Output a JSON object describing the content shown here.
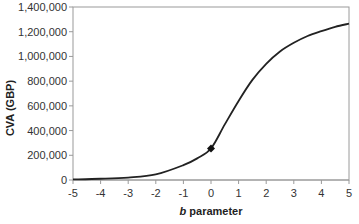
{
  "chart_data": {
    "type": "line",
    "title": "",
    "xlabel_var": "b",
    "xlabel_rest": " parameter",
    "xlabel": "b parameter",
    "ylabel": "CVA (GBP)",
    "xlim": [
      -5,
      5
    ],
    "ylim": [
      0,
      1400000
    ],
    "x_ticks": [
      "-5",
      "-4",
      "-3",
      "-2",
      "-1",
      "0",
      "1",
      "2",
      "3",
      "4",
      "5"
    ],
    "y_ticks": [
      "0",
      "200,000",
      "400,000",
      "600,000",
      "800,000",
      "1,000,000",
      "1,200,000",
      "1,400,000"
    ],
    "grid": false,
    "legend": null,
    "series": [
      {
        "name": "CVA",
        "x": [
          -5,
          -4,
          -3,
          -2,
          -1,
          -0.5,
          0,
          0.5,
          1,
          1.5,
          2,
          2.5,
          3,
          3.5,
          4,
          4.5,
          5
        ],
        "values": [
          5000,
          10000,
          20000,
          45000,
          120000,
          175000,
          255000,
          450000,
          640000,
          810000,
          940000,
          1040000,
          1110000,
          1165000,
          1205000,
          1240000,
          1265000
        ]
      }
    ],
    "annotations": [
      {
        "type": "diamond-marker",
        "x": 0,
        "y": 255000
      }
    ]
  }
}
